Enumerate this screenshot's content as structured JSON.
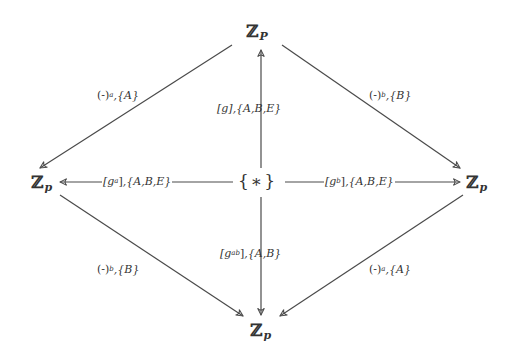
{
  "diagram": {
    "type": "commutative-diagram",
    "nodes": {
      "top": {
        "symbol": "ℤ",
        "subscript": "P"
      },
      "left": {
        "symbol": "ℤ",
        "subscript": "p"
      },
      "center": {
        "label": "{∗}"
      },
      "right": {
        "symbol": "ℤ",
        "subscript": "p"
      },
      "bottom": {
        "symbol": "ℤ",
        "subscript": "p"
      }
    },
    "edges": {
      "top_to_left": {
        "from": "top",
        "to": "left",
        "map": "(-)",
        "exp": "a",
        "set": ",{A}"
      },
      "top_to_right": {
        "from": "top",
        "to": "right",
        "map": "(-)",
        "exp": "b",
        "set": ",{B}"
      },
      "center_to_top": {
        "from": "center",
        "to": "top",
        "map": "[g]",
        "set": ",{A,B,E}"
      },
      "center_to_left": {
        "from": "center",
        "to": "left",
        "map_open": "[g",
        "exp": "a",
        "map_close": "]",
        "set": ",{A,B,E}"
      },
      "center_to_right": {
        "from": "center",
        "to": "right",
        "map_open": "[g",
        "exp": "b",
        "map_close": "]",
        "set": ",{A,B,E}"
      },
      "center_to_bottom": {
        "from": "center",
        "to": "bottom",
        "map_open": "[g",
        "exp": "ab",
        "map_close": "]",
        "set": ",{A,B}"
      },
      "left_to_bottom": {
        "from": "left",
        "to": "bottom",
        "map": "(-)",
        "exp": "b",
        "set": ",{B}"
      },
      "right_to_bottom": {
        "from": "right",
        "to": "bottom",
        "map": "(-)",
        "exp": "a",
        "set": ",{A}"
      }
    },
    "colors": {
      "line": "#4a4a4a",
      "text": "#333333",
      "background": "#ffffff"
    }
  }
}
